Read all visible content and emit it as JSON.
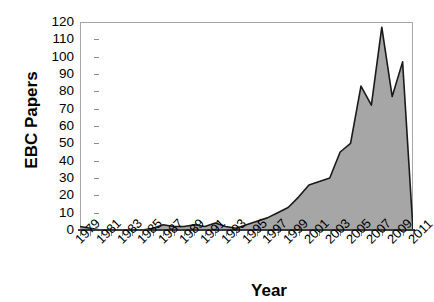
{
  "chart_data": {
    "type": "area",
    "title": "",
    "xlabel": "Year",
    "ylabel": "EBC Papers",
    "xlim": [
      1979,
      2011
    ],
    "ylim": [
      0,
      120
    ],
    "ytick_step": 10,
    "xtick_step": 2,
    "grid": false,
    "legend": null,
    "series_fill_color": "#a6a6a6",
    "series_line_color": "#1a1a1a",
    "axis_color": "#8c8c8c",
    "x": [
      1979,
      1980,
      1981,
      1982,
      1983,
      1984,
      1985,
      1986,
      1987,
      1988,
      1989,
      1990,
      1991,
      1992,
      1993,
      1994,
      1995,
      1996,
      1997,
      1998,
      1999,
      2000,
      2001,
      2002,
      2003,
      2004,
      2005,
      2006,
      2007,
      2008,
      2009,
      2010,
      2011
    ],
    "values": [
      2,
      1,
      0,
      0,
      0,
      0,
      0,
      1,
      3,
      2,
      2,
      3,
      2,
      4,
      2,
      1,
      3,
      5,
      7,
      10,
      13,
      19,
      26,
      28,
      30,
      45,
      50,
      83,
      72,
      117,
      77,
      97,
      0
    ],
    "ytick_labels": [
      "120",
      "110",
      "100",
      "90",
      "80",
      "70",
      "60",
      "50",
      "40",
      "30",
      "20",
      "10",
      "0"
    ],
    "xtick_labels": [
      "1979",
      "1981",
      "1983",
      "1985",
      "1987",
      "1989",
      "1991",
      "1993",
      "1995",
      "1997",
      "1999",
      "2001",
      "2003",
      "2005",
      "2007",
      "2009",
      "2011"
    ]
  }
}
